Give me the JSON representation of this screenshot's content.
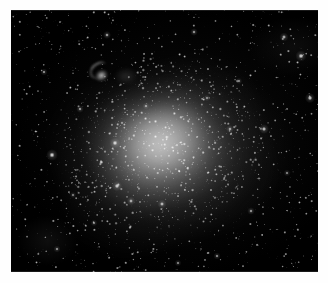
{
  "image": {
    "kind": "astronomical-photograph",
    "subject": "dwarf irregular galaxy in a dense star field",
    "caption": "",
    "frame": {
      "x": 11,
      "y": 10,
      "width": 307,
      "height": 262
    },
    "page_background": "#fefefe",
    "sky_background": "#000000",
    "star_color": "#ffffff",
    "glow_color": "#e8e8e8"
  },
  "objects": {
    "galaxy": {
      "name": "main-galaxy",
      "center": {
        "x": 150,
        "y": 135
      },
      "semi_major": 105,
      "semi_minor": 87,
      "position_angle_deg": -16,
      "peak_brightness": 0.6
    },
    "companion": {
      "name": "companion-nebula",
      "center": {
        "x": 89,
        "y": 63
      },
      "width": 26,
      "height": 22
    },
    "faint_patch": {
      "name": "faint-diffuse-patch",
      "center": {
        "x": 115,
        "y": 66
      },
      "width": 22,
      "height": 16
    }
  },
  "starfield": {
    "background_star_count": 1500,
    "resolved_member_count": 900,
    "bright_stars": [
      {
        "x": 41,
        "y": 145,
        "r": 2.6,
        "i": 1.0
      },
      {
        "x": 104,
        "y": 133,
        "r": 2.4,
        "i": 0.98
      },
      {
        "x": 106,
        "y": 176,
        "r": 2.3,
        "i": 0.95
      },
      {
        "x": 290,
        "y": 46,
        "r": 2.5,
        "i": 0.97
      },
      {
        "x": 299,
        "y": 88,
        "r": 2.3,
        "i": 0.94
      },
      {
        "x": 253,
        "y": 119,
        "r": 2.2,
        "i": 0.92
      },
      {
        "x": 273,
        "y": 27,
        "r": 2.0,
        "i": 0.88
      },
      {
        "x": 151,
        "y": 194,
        "r": 2.0,
        "i": 0.9
      },
      {
        "x": 120,
        "y": 191,
        "r": 1.9,
        "i": 0.86
      },
      {
        "x": 219,
        "y": 119,
        "r": 1.8,
        "i": 0.84
      },
      {
        "x": 96,
        "y": 25,
        "r": 1.8,
        "i": 0.85
      },
      {
        "x": 183,
        "y": 22,
        "r": 1.7,
        "i": 0.82
      },
      {
        "x": 69,
        "y": 99,
        "r": 1.7,
        "i": 0.82
      },
      {
        "x": 33,
        "y": 62,
        "r": 1.6,
        "i": 0.8
      },
      {
        "x": 240,
        "y": 201,
        "r": 1.7,
        "i": 0.8
      },
      {
        "x": 206,
        "y": 246,
        "r": 1.6,
        "i": 0.78
      },
      {
        "x": 46,
        "y": 239,
        "r": 1.6,
        "i": 0.78
      },
      {
        "x": 312,
        "y": 232,
        "r": 1.6,
        "i": 0.76
      },
      {
        "x": 167,
        "y": 253,
        "r": 1.5,
        "i": 0.76
      },
      {
        "x": 83,
        "y": 213,
        "r": 1.5,
        "i": 0.74
      },
      {
        "x": 276,
        "y": 163,
        "r": 1.5,
        "i": 0.74
      },
      {
        "x": 135,
        "y": 96,
        "r": 1.5,
        "i": 0.8
      },
      {
        "x": 196,
        "y": 88,
        "r": 1.4,
        "i": 0.76
      },
      {
        "x": 228,
        "y": 71,
        "r": 1.4,
        "i": 0.74
      },
      {
        "x": 62,
        "y": 185,
        "r": 1.4,
        "i": 0.72
      }
    ]
  }
}
